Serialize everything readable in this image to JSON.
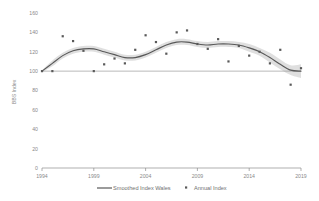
{
  "chart_data": {
    "type": "line",
    "title": "",
    "xlabel": "",
    "ylabel": "BBS Index",
    "xlim": [
      1994,
      2019
    ],
    "ylim": [
      0,
      160
    ],
    "ytick_step": 20,
    "yticks": [
      0,
      20,
      40,
      60,
      80,
      100,
      120,
      140,
      160
    ],
    "xticks": [
      1994,
      1999,
      2004,
      2009,
      2014,
      2019
    ],
    "grid": false,
    "legend_position": "bottom",
    "reference_line": {
      "value": 100,
      "label": ""
    },
    "series": [
      {
        "name": "Smoothed Index Wales",
        "type": "line",
        "color": "#595959",
        "band": {
          "name": "confidence-band",
          "color": "#d9d9d9"
        },
        "x": [
          1994,
          1995,
          1996,
          1997,
          1998,
          1999,
          2000,
          2001,
          2002,
          2003,
          2004,
          2005,
          2006,
          2007,
          2008,
          2009,
          2010,
          2011,
          2012,
          2013,
          2014,
          2015,
          2016,
          2017,
          2018,
          2019
        ],
        "values": [
          100,
          108,
          116,
          121,
          123,
          123,
          120,
          117,
          114,
          114,
          117,
          122,
          127,
          130,
          130,
          128,
          127,
          128,
          128,
          127,
          124,
          120,
          114,
          107,
          101,
          100
        ],
        "band_upper": [
          101,
          111,
          119,
          124,
          126,
          126,
          123,
          120,
          117,
          117,
          120,
          125,
          130,
          133,
          133,
          131,
          130,
          131,
          131,
          130,
          128,
          124,
          119,
          112,
          106,
          107
        ],
        "band_lower": [
          99,
          105,
          113,
          118,
          120,
          120,
          117,
          114,
          111,
          111,
          114,
          119,
          124,
          127,
          127,
          125,
          124,
          125,
          125,
          124,
          120,
          116,
          109,
          102,
          96,
          93
        ]
      },
      {
        "name": "Annual Index",
        "type": "scatter",
        "color": "#595959",
        "marker": "square",
        "x": [
          1994,
          1995,
          1996,
          1997,
          1998,
          1999,
          2000,
          2001,
          2002,
          2003,
          2004,
          2005,
          2006,
          2007,
          2008,
          2009,
          2010,
          2011,
          2012,
          2013,
          2014,
          2015,
          2016,
          2017,
          2018,
          2019
        ],
        "values": [
          100,
          100,
          136,
          131,
          121,
          100,
          107,
          113,
          108,
          122,
          137,
          130,
          118,
          140,
          142,
          128,
          123,
          133,
          110,
          126,
          116,
          120,
          108,
          122,
          86,
          103
        ]
      }
    ]
  },
  "legend": {
    "items": [
      {
        "label": "Smoothed Index Wales",
        "marker": "line"
      },
      {
        "label": "Annual Index",
        "marker": "square"
      }
    ]
  },
  "axes": {
    "y_title": "BBS Index",
    "y_tick_labels": [
      "160",
      "140",
      "120",
      "100",
      "80",
      "60",
      "40",
      "20",
      "0"
    ],
    "x_tick_labels": [
      "1994",
      "1999",
      "2004",
      "2009",
      "2014",
      "2019"
    ]
  }
}
